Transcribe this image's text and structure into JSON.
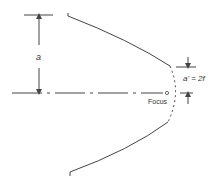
{
  "diagram": {
    "labels": {
      "a": "a",
      "a_prime": "a' = 2f",
      "focus": "Focus"
    },
    "colors": {
      "stroke": "#444444",
      "background": "#ffffff"
    }
  }
}
